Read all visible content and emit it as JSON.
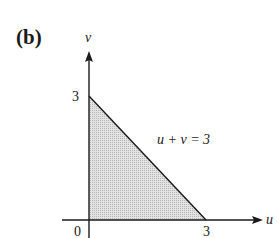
{
  "panel_label": "(b)",
  "axes": {
    "x_label": "u",
    "y_label": "v",
    "origin_label": "0",
    "x_tick": "3",
    "y_tick": "3"
  },
  "line_label": "u + v = 3",
  "region": {
    "description": "shaded triangle bounded by u=0, v=0 and u+v=3",
    "vertices": [
      [
        0,
        0
      ],
      [
        3,
        0
      ],
      [
        0,
        3
      ]
    ],
    "fill": "#d4d4d4"
  },
  "colors": {
    "axis": "#1a1a1a",
    "shade": "#d4d4d4"
  }
}
